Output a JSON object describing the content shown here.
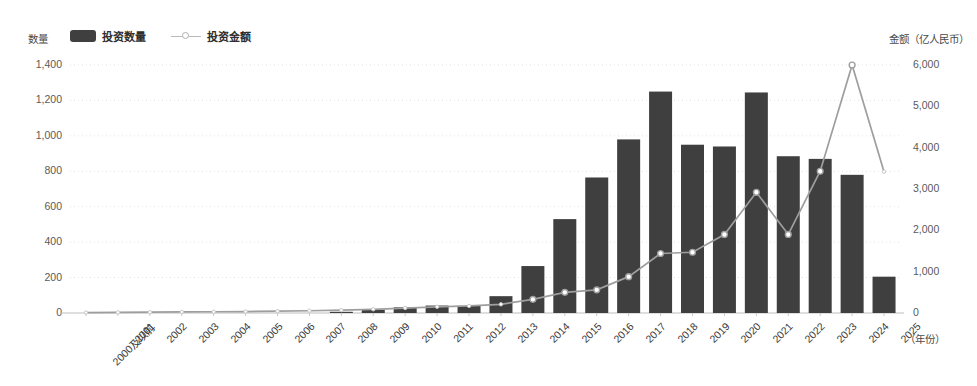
{
  "legend": {
    "left_axis_title": "数量",
    "right_axis_title": "金额（亿人民币）",
    "items": [
      {
        "label": "投资数量",
        "marker": "bar-swatch",
        "color": "#3f3f3f"
      },
      {
        "label": "投资金额",
        "marker": "line-swatch",
        "color": "#b0b0b0"
      }
    ]
  },
  "chart_data": {
    "type": "bar",
    "title": "",
    "subtitle": "",
    "xlabel": "（年份）",
    "ylabel": "数量",
    "y2label": "金额（亿人民币）",
    "grid": true,
    "legend_position": "top-left",
    "categories": [
      "2000及以前",
      "2001",
      "2002",
      "2003",
      "2004",
      "2005",
      "2006",
      "2007",
      "2008",
      "2009",
      "2010",
      "2011",
      "2012",
      "2013",
      "2014",
      "2015",
      "2016",
      "2017",
      "2018",
      "2019",
      "2020",
      "2021",
      "2022",
      "2023",
      "2024",
      "2025"
    ],
    "ylim": [
      0,
      1400
    ],
    "yticks": [
      "0",
      "200",
      "400",
      "600",
      "800",
      "1,000",
      "1,200",
      "1,400"
    ],
    "ytick_values": [
      0,
      200,
      400,
      600,
      800,
      1000,
      1200,
      1400
    ],
    "y2lim": [
      0,
      6000
    ],
    "y2ticks": [
      "0",
      "1,000",
      "2,000",
      "3,000",
      "4,000",
      "5,000",
      "6,000"
    ],
    "y2tick_values": [
      0,
      1000,
      2000,
      3000,
      4000,
      5000,
      6000
    ],
    "series": [
      {
        "name": "投资数量",
        "kind": "bar",
        "axis": "left",
        "color": "#3f3f3f",
        "values": [
          0,
          0,
          0,
          0,
          0,
          0,
          0,
          0,
          5,
          18,
          32,
          42,
          40,
          95,
          265,
          530,
          765,
          980,
          1250,
          950,
          940,
          1245,
          885,
          870,
          780,
          205
        ]
      },
      {
        "name": "投资金额",
        "kind": "line",
        "axis": "right",
        "color": "#9e9e9e",
        "marker_fill": "#ffffff",
        "values": [
          10,
          15,
          20,
          25,
          30,
          35,
          45,
          55,
          70,
          90,
          120,
          150,
          170,
          210,
          330,
          500,
          560,
          880,
          1440,
          1470,
          1900,
          2920,
          1900,
          3430,
          6000,
          3420
        ]
      }
    ]
  }
}
